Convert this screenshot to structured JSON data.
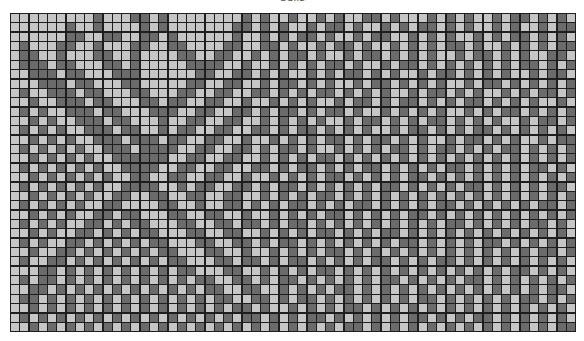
{
  "title": "Cells",
  "colors": {
    "light": "#c6c6c6",
    "dark": "#6b6b6b",
    "gridline": "#1e1e1e"
  },
  "grid": {
    "columns": 61,
    "rows": [
      "LLLLLLLLLDLLLDDLDLLLLLLLLDLDLLDLLDLDLLDDLDLLLDLDLDLLDLDDLDLDL",
      "LLLLLLDLLDLLLLDLDLLLLLLLDDLDLDLLDLDDLDLLDLDLDDLDLDLLDLDLLDLDD",
      "LLLLLLDDLLDDLLDDLDLLLLLLDLLDLDLDDLDLLDLDDLLDLDLDLLDLDLDDLDLDL",
      "LDLLLDDLLDLLLDDLLDDLLLLDDLLDDLDLLDLDDLDLLDLDLDLDDLDLLDLDLDLDD",
      "LDDLLDLLLDDLLDLLLLDDLLDDLLDLDLDDLDLLDLDDLDLDLDLLDLDDLDLDLLDDL",
      "LDDDLDDLLLDDLDLLLLLDDDDLLDLLDLDLDLDDLDLLDLDDLDLDLDLDLDLDDLDLD",
      "LLDDDLDDLLLDDDLLLLLLDDLLDDLDLDLLDLDLDDLDLDLLDLDDLDLDLDLLDLDDL",
      "LLLDDDLDDLLLDDLLLLLDDLLDDLLDLDDLDLDLLDLDDLDLDLDLLDLDDLDLDLDLD",
      "LDLLDDDLDDLLLDDLLLDDLLDDLLDDLDLDLDDLDLDLDLLDLDDLDLDLLDLDLDDLD",
      "LLDLLDDDLDDLLLDDLDDLLDDLLDLLDLDLDLLDLDDLDLDDLDLDLDDLDLDLDLLDL",
      "LDLDLLDDDLDDLLLDDDLLDDLLDDLDLDDLDLDDLDLLDLDLDLDLLDLDLDDLDLDLD",
      "LLDLDLLDDDLDDLLLDLLDDLLDDLLDLDLDLDLLDLDDLDLDLDDLDLDLDLLDLDDLD",
      "LDLDLDLLDDDLDDLLDLDDLLDDLLDDLDLDDLDLDLDLLDLDDLDLDLDDLDLDLDLDL",
      "LLDLDLDLLDDDLDDDLDDLLDDLLDLLDLDLDLDDLDLDDLDLDLLDLDDLDLDLLDLDD",
      "LDLDLDLDLLDDDLDDDDLLDDLLDDLDLDDLDLLDLDLDLDDLDLDDLDLDLDDLDLDLD",
      "LLDLDLDLDLLDDDDDDLLDDLLDDLLDLDLDLDDLDLDLDLDLDLDLDLDLDLDLDLDLD",
      "LDLDLDLDLDLLDDDDLLDDLLDDLLDDLDLDDLDLDLDDLDLDLDLDDLDLDLDLDDLDL",
      "LLDLDLDLDLDLLDDLLDDLLDDLLDLLDLDLDLDDLDLDLDLDDLDLDLDLDLDLDLDLD",
      "LDLDLDLDLDLLDDDDLLDLDDLLDDLDLDDLDLDLDLDLDDLDLDLDLDDLDLDLDLDDL",
      "LLDLDLDLDLLDDLLDDLLDDLLDDLLDLDLDLDDLDLDLDLDLDLDLDLDLDLDLDLDLD",
      "LDLDLDLDLLDDLLLLDDLLDLLDDLDLDLDDLDLDLDDLDLDLDLDDLDLDLDLDLDDLD",
      "LLDLDLDLLDDLDDLLLDDLLDDLLDLLDLDLDLDDLDLDLDLDDLDLDLDLDLDLDLDLD",
      "LDLDLDLLDDLDLDDLLLDDLLDDLDDLDLDDLDLDLDLDLDLDLDLDDLDLDLDLDDLDL",
      "LLDLDLLDDLDLDLDDLLLDDLLDDLLDLDLDLDDLDLDLDDLDLDLDLDLDLDLDLDLDL",
      "LDLDLLDDLDLDLDLDDLLLDDLLDDLDLDDLDLDLDLDLDLDDLDLDLDLDDLDLDLDLD",
      "LLDLLDDLDLDLDLDLDDLLLDDLLDLLDLDLDLDDLDLDLDLDLDLDLDLDLDLDLDDLD",
      "LDLLDDLDLDLDLDLDLDDLLLDDLDDLDLDDLDLDLDLDDLDLDLDDLDLDLDLDLDLDL",
      "LLLDDLDLDLDLDLDLDLDDLLLDDLLDLDLDLDDLDLDLDLDLDLDLDLDLDLDDLDLDL",
      "LDLDDLDLDLDLDLDLDLDLDDLLDDLDLDDLDLDLDLDLDDLDLDLDLDDLDLDLDLDLD",
      "LLDDLDLDLDLDLDLDLDLDLDDLLDDLLDLDLDLDDLDLDLDLDLDLDLDLDLDLDLDDL",
      "LDDLDLDLDLDLDLDLDLDLDLDDLLDDLDLDDLDLDLDLDLDLDDLDLDLDLDLDDLDLD",
      "LLDLDLDLDLDLDLDLDLDLDLDLDDLDLLDLDLDLDDLDLDLDLDLDLDLDLDLDLDLDL",
      "LDLDLDLDLDLDLDLDLDLDLDLDLDDLDLDLDDLDLDLDLDLDDLDLDLDDLDLDLDLDL",
      "LLDLDLDLDLDLDLDLDLDLDLDLDLDLDLDLDLDLDDLDLDLDLDLDLDLDLDLDLDLDD"
    ]
  }
}
